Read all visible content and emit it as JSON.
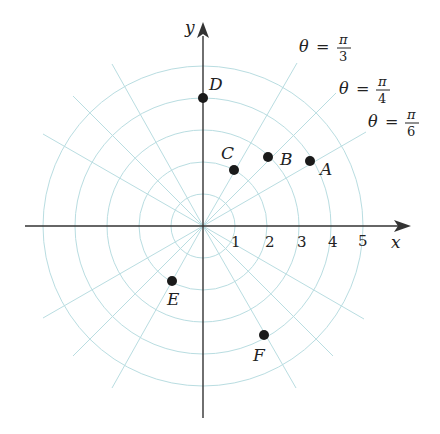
{
  "diagram": {
    "type": "polar-coordinate-grid",
    "origin_px": [
      203,
      226
    ],
    "unit_px": 32,
    "circle_radii": [
      1,
      2,
      3,
      4,
      5
    ],
    "grid_color": "#b9dde1",
    "axis_color": "#333333",
    "axes": {
      "x_label": "x",
      "y_label": "y",
      "x_ticks": [
        "1",
        "2",
        "3",
        "4",
        "5"
      ]
    },
    "ray_labels": [
      {
        "theta": "θ",
        "eq": "=",
        "num": "π",
        "den": "3"
      },
      {
        "theta": "θ",
        "eq": "=",
        "num": "π",
        "den": "4"
      },
      {
        "theta": "θ",
        "eq": "=",
        "num": "π",
        "den": "6"
      }
    ],
    "points": [
      {
        "label": "A",
        "r": 4,
        "theta": "π/6"
      },
      {
        "label": "B",
        "r": 3,
        "theta": "π/4"
      },
      {
        "label": "C",
        "r": 2,
        "theta": "π/3"
      },
      {
        "label": "D",
        "r": 4,
        "theta": "π/2"
      },
      {
        "label": "E",
        "r": 2,
        "theta": "4π/3"
      },
      {
        "label": "F",
        "r": 4,
        "theta": "5π/3"
      }
    ]
  }
}
